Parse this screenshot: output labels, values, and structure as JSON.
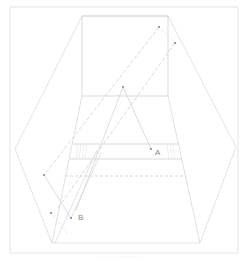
{
  "diagram": {
    "frame": {
      "x": 10,
      "y": 7,
      "w": 228,
      "h": 246,
      "stroke": "#e6e6e6"
    },
    "line_color": "#d6d6d6",
    "dashed_color": "#d0d0d0",
    "dot_color": "#8a8a8a",
    "label_color": "#888888",
    "hexagon": [
      [
        82,
        16
      ],
      [
        168,
        16
      ],
      [
        236,
        147
      ],
      [
        200,
        243
      ],
      [
        52,
        243
      ],
      [
        15,
        149
      ]
    ],
    "inner_square": {
      "x1": 82,
      "y1": 16,
      "x2": 168,
      "y2": 96
    },
    "band": {
      "top_y": 144,
      "bottom_y": 159,
      "dashed_y": 176
    },
    "labels": {
      "A": "A",
      "B": "B"
    },
    "points": {
      "p_top1": [
        159,
        27
      ],
      "p_top2": [
        175,
        43
      ],
      "apex": [
        123,
        87
      ],
      "A": [
        151,
        149
      ],
      "left": [
        44,
        175
      ],
      "low_left": [
        51,
        213
      ],
      "B": [
        71,
        218
      ]
    }
  },
  "caption": "· · ·   · ·   · · · ·   · · ·"
}
